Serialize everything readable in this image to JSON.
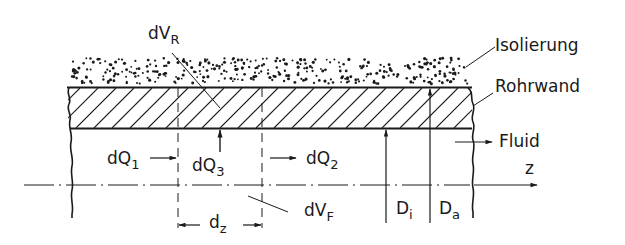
{
  "diagram": {
    "type": "technical-cross-section",
    "labels": {
      "dVR": {
        "main": "dV",
        "sub": "R"
      },
      "isolierung": "Isolierung",
      "rohrwand": "Rohrwand",
      "fluid": "Fluid",
      "z": "z",
      "dQ1": {
        "main": "dQ",
        "sub": "1"
      },
      "dQ2": {
        "main": "dQ",
        "sub": "2"
      },
      "dQ3": {
        "main": "dQ",
        "sub": "3"
      },
      "dz": {
        "main": "d",
        "sub": "z"
      },
      "dVF": {
        "main": "dV",
        "sub": "F"
      },
      "Di": {
        "main": "D",
        "sub": "i"
      },
      "Da": {
        "main": "D",
        "sub": "a"
      }
    },
    "layers": [
      {
        "name": "Isolierung",
        "pattern": "dots"
      },
      {
        "name": "Rohrwand",
        "pattern": "hatch"
      },
      {
        "name": "Fluid",
        "pattern": "none"
      }
    ],
    "colors": {
      "ink": "#1a1a1a",
      "background": "#ffffff"
    }
  }
}
